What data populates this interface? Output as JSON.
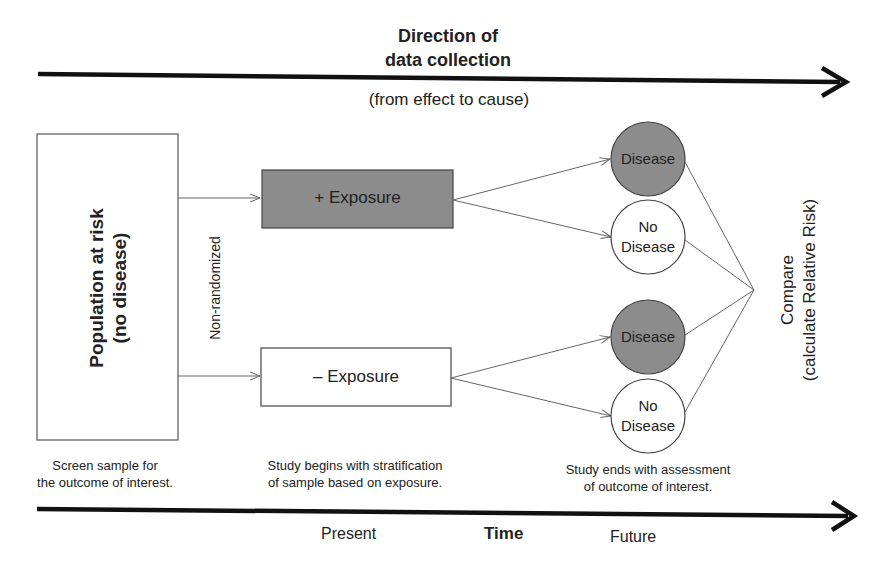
{
  "header": {
    "title_line1": "Direction of",
    "title_line2": "data collection",
    "subtitle": "(from effect to cause)"
  },
  "population": {
    "line1": "Population at risk",
    "line2": "(no disease)"
  },
  "branch_label": "Non-randomized",
  "exposure": {
    "positive": "+ Exposure",
    "negative": "– Exposure"
  },
  "outcomes": [
    {
      "label_line1": "Disease",
      "label_line2": "",
      "filled": true
    },
    {
      "label_line1": "No",
      "label_line2": "Disease",
      "filled": false
    },
    {
      "label_line1": "Disease",
      "label_line2": "",
      "filled": true
    },
    {
      "label_line1": "No",
      "label_line2": "Disease",
      "filled": false
    }
  ],
  "compare": {
    "line1": "Compare",
    "line2": "(calculate Relative Risk)"
  },
  "captions": {
    "screen_line1": "Screen sample for",
    "screen_line2": "the outcome of interest.",
    "begin_line1": "Study begins with stratification",
    "begin_line2": "of sample based on exposure.",
    "end_line1": "Study ends with assessment",
    "end_line2": "of outcome of interest."
  },
  "timeline": {
    "present": "Present",
    "time": "Time",
    "future": "Future"
  },
  "colors": {
    "filled": "#8c8c8c",
    "stroke": "#555555",
    "arrow": "#111111"
  }
}
